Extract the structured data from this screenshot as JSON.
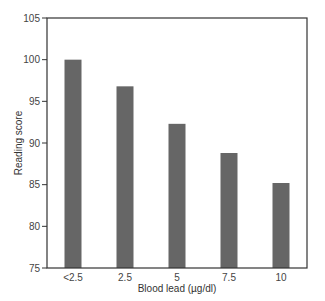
{
  "chart_data": {
    "type": "bar",
    "title": "",
    "xlabel": "Blood lead (µg/dl)",
    "ylabel": "Reading score",
    "categories": [
      "<2.5",
      "2.5",
      "5",
      "7.5",
      "10"
    ],
    "values": [
      100.0,
      96.8,
      92.3,
      88.8,
      85.2
    ],
    "ylim": [
      75,
      105
    ],
    "yticks": [
      75,
      80,
      85,
      90,
      95,
      100,
      105
    ],
    "grid": false,
    "legend": null,
    "bar_color": "#666666"
  }
}
